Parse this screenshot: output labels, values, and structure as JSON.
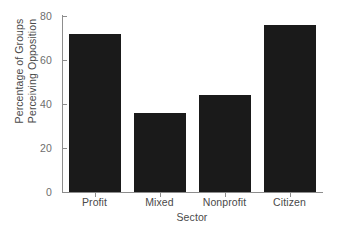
{
  "chart_data": {
    "type": "bar",
    "title": "",
    "xlabel": "Sector",
    "ylabel_line1": "Percentage of Groups",
    "ylabel_line2": "Perceiving Opposition",
    "categories": [
      "Profit",
      "Mixed",
      "Nonprofit",
      "Citizen"
    ],
    "values": [
      72,
      36,
      44,
      76
    ],
    "ylim": [
      0,
      80
    ],
    "yticks": [
      0,
      20,
      40,
      60,
      80
    ],
    "ytick_labels": [
      "0",
      "20",
      "40",
      "60",
      "80"
    ],
    "grid": false,
    "legend": false,
    "bar_color": "#1a1a1a",
    "axis_color": "#8d8d8d",
    "text_color": "#4a4a4a"
  }
}
